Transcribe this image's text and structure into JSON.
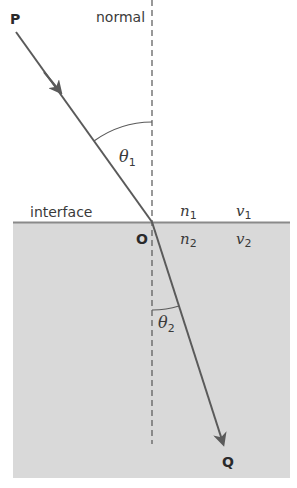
{
  "diagram": {
    "labels": {
      "start_point": "P",
      "end_point": "Q",
      "incidence_point": "O",
      "normal": "normal",
      "interface": "interface",
      "theta1": "θ",
      "theta1_sub": "1",
      "theta2": "θ",
      "theta2_sub": "2",
      "n1": "n",
      "n1_sub": "1",
      "v1": "v",
      "v1_sub": "1",
      "n2": "n",
      "n2_sub": "2",
      "v2": "v",
      "v2_sub": "2"
    },
    "colors": {
      "ray": "#5a5a5a",
      "normal_line": "#555555",
      "medium2_fill": "#d9d9d9",
      "interface_line": "#8a8a8a",
      "background": "#ffffff"
    },
    "geometry": {
      "P": [
        16,
        32
      ],
      "O": [
        152,
        222
      ],
      "Q": [
        224,
        446
      ],
      "normal_x": 152,
      "medium2_rect": [
        13,
        222,
        277,
        256
      ]
    }
  }
}
